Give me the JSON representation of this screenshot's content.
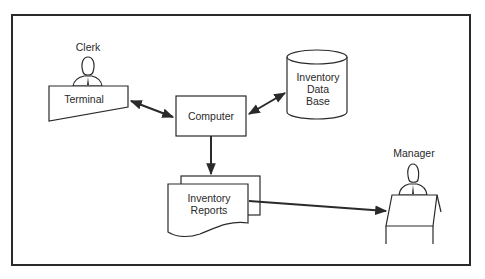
{
  "diagram": {
    "type": "inventory system flow",
    "nodes": {
      "clerk": {
        "label": "Clerk"
      },
      "terminal": {
        "label": "Terminal"
      },
      "computer": {
        "label": "Computer"
      },
      "database": {
        "line1": "Inventory",
        "line2": "Data",
        "line3": "Base"
      },
      "reports": {
        "line1": "Inventory",
        "line2": "Reports"
      },
      "manager": {
        "label": "Manager"
      }
    },
    "edges": [
      {
        "from": "terminal",
        "to": "computer",
        "direction": "bidirectional"
      },
      {
        "from": "computer",
        "to": "database",
        "direction": "bidirectional"
      },
      {
        "from": "computer",
        "to": "reports",
        "direction": "forward"
      },
      {
        "from": "reports",
        "to": "manager",
        "direction": "forward"
      }
    ],
    "colors": {
      "ink": "#2a2a2a",
      "background": "#ffffff"
    }
  }
}
